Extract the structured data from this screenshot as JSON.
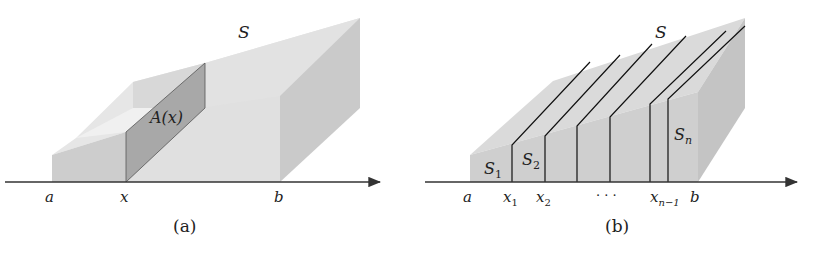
{
  "panel_a": {
    "solid_label": "S",
    "cross_section_label": "A(x)",
    "axis_labels": {
      "a": "a",
      "x": "x",
      "b": "b"
    },
    "caption": "(a)"
  },
  "panel_b": {
    "solid_label": "S",
    "slice_labels": {
      "s1_base": "S",
      "s1_sub": "1",
      "s2_base": "S",
      "s2_sub": "2",
      "sn_base": "S",
      "sn_sub": "n"
    },
    "axis_labels": {
      "a": "a",
      "x1_base": "x",
      "x1_sub": "1",
      "x2_base": "x",
      "x2_sub": "2",
      "dots": "· · ·",
      "xn1_base": "x",
      "xn1_sub": "n−1",
      "b": "b"
    },
    "caption": "(b)"
  },
  "colors": {
    "face_light": "#e4e4e4",
    "face_mid": "#d2d2d2",
    "face_dark": "#bdbdbd",
    "cross_section": "#a9a9a9",
    "axis": "#333333",
    "slice_line": "#111111"
  }
}
